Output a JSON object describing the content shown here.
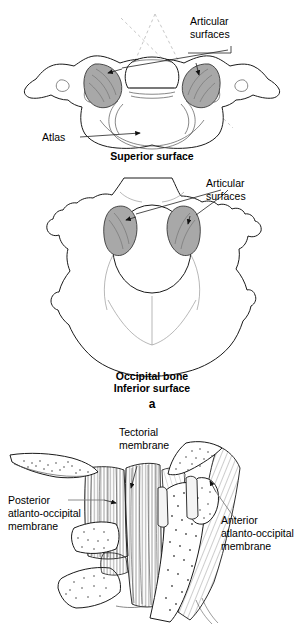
{
  "figure": {
    "background_color": "#ffffff",
    "ink_color": "#1a1a1a",
    "facet_shade_color": "#a8a8a8"
  },
  "panel_a": {
    "letter": "a",
    "superior": {
      "caption": "Superior surface",
      "labels": {
        "articular_surfaces": "Articular\nsurfaces",
        "articular_surfaces_line1": "Articular",
        "articular_surfaces_line2": "surfaces",
        "atlas": "Atlas"
      }
    },
    "inferior": {
      "caption_line1": "Occipital bone",
      "caption_line2": "Inferior surface",
      "labels": {
        "articular_surfaces_line1": "Articular",
        "articular_surfaces_line2": "surfaces"
      }
    }
  },
  "panel_b": {
    "labels": {
      "tectorial_line1": "Tectorial",
      "tectorial_line2": "membrane",
      "posterior_line1": "Posterior",
      "posterior_line2": "atlanto-occipital",
      "posterior_line3": "membrane",
      "anterior_line1": "Anterior",
      "anterior_line2": "atlanto-occipital",
      "anterior_line3": "membrane"
    }
  }
}
